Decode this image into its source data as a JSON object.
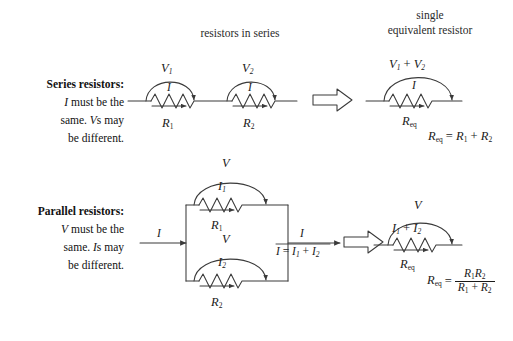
{
  "figure": {
    "background": "#ffffff",
    "ink": "#1a1a1a"
  },
  "headers": {
    "series_columns": "resistors in series",
    "equivalent_line1": "single",
    "equivalent_line2": "equivalent resistor"
  },
  "rows": [
    {
      "id": "series",
      "caption": {
        "title": "Series resistors:",
        "line2_pre": "I",
        "line2_post": " must be the",
        "line3_pre": "same. ",
        "line3_mid": "V",
        "line3_post": "s may",
        "line4": "be different."
      },
      "circuit": {
        "resistor1": {
          "voltage": "V",
          "voltage_sub": "1",
          "current": "I",
          "name": "R",
          "name_sub": "1"
        },
        "resistor2": {
          "voltage": "V",
          "voltage_sub": "2",
          "current": "I",
          "name": "R",
          "name_sub": "2"
        }
      },
      "equivalent": {
        "voltage_expr": {
          "a": "V",
          "a_sub": "1",
          "op": "+",
          "b": "V",
          "b_sub": "2"
        },
        "current": "I",
        "name": "R",
        "name_sub": "eq",
        "formula": {
          "lhs": "R",
          "lhs_sub": "eq",
          "eq": "=",
          "t1": "R",
          "t1_sub": "1",
          "op": "+",
          "t2": "R",
          "t2_sub": "2"
        }
      }
    },
    {
      "id": "parallel",
      "caption": {
        "title": "Parallel resistors:",
        "line2_pre": "V",
        "line2_post": " must be the",
        "line3_pre": "same. ",
        "line3_mid": "I",
        "line3_post": "s may",
        "line4": "be different."
      },
      "circuit": {
        "input_current": "I",
        "branch_top": {
          "voltage": "V",
          "current": "I",
          "current_sub": "1",
          "name": "R",
          "name_sub": "1"
        },
        "branch_bottom": {
          "voltage": "V",
          "current": "I",
          "current_sub": "2",
          "name": "R",
          "name_sub": "2"
        },
        "output_current": "I",
        "kcl": {
          "lhs": "I",
          "eq": "=",
          "t1": "I",
          "t1_sub": "1",
          "op": "+",
          "t2": "I",
          "t2_sub": "2"
        }
      },
      "equivalent": {
        "voltage": "V",
        "current_expr": {
          "a": "I",
          "a_sub": "1",
          "op": "+",
          "b": "I",
          "b_sub": "2"
        },
        "name": "R",
        "name_sub": "eq",
        "formula": {
          "lhs": "R",
          "lhs_sub": "eq",
          "eq": "=",
          "numerator": {
            "t1": "R",
            "t1_sub": "1",
            "t2": "R",
            "t2_sub": "2"
          },
          "denominator": {
            "t1": "R",
            "t1_sub": "1",
            "op": "+",
            "t2": "R",
            "t2_sub": "2"
          }
        }
      }
    }
  ],
  "glyphs": {
    "implies_arrow": "block-arrow-right"
  }
}
